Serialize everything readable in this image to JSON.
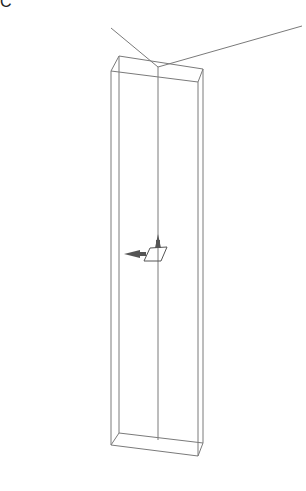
{
  "viewport": {
    "corner_glyph": "C",
    "colors": {
      "background": "#ffffff",
      "wire": "#777777",
      "wire_dark": "#555555",
      "gizmo": "#555555"
    },
    "objects": [
      {
        "name": "wireframe-box",
        "type": "box"
      },
      {
        "name": "light-line-left",
        "type": "line"
      },
      {
        "name": "light-line-right",
        "type": "line"
      },
      {
        "name": "center-axis-line",
        "type": "line"
      },
      {
        "name": "translate-gizmo",
        "type": "gizmo"
      }
    ]
  }
}
